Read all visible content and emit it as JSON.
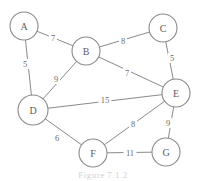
{
  "figure": {
    "caption": "Figure 7.1.2",
    "width": 206,
    "height": 181,
    "line_color": "#8a8a8a",
    "text_color": "#5c5c5c",
    "background": "#ffffff"
  },
  "chart_data": {
    "type": "diagram",
    "subtype": "weighted-undirected-graph",
    "title": "Figure 7.1.2",
    "nodes": [
      {
        "id": "A",
        "label": "A",
        "x": 24,
        "y": 26,
        "r": 14
      },
      {
        "id": "B",
        "label": "B",
        "x": 86,
        "y": 51,
        "r": 14
      },
      {
        "id": "C",
        "label": "C",
        "x": 163,
        "y": 28,
        "r": 14
      },
      {
        "id": "D",
        "label": "D",
        "x": 33,
        "y": 110,
        "r": 15
      },
      {
        "id": "E",
        "label": "E",
        "x": 176,
        "y": 93,
        "r": 14
      },
      {
        "id": "F",
        "label": "F",
        "x": 93,
        "y": 153,
        "r": 14
      },
      {
        "id": "G",
        "label": "G",
        "x": 166,
        "y": 152,
        "r": 14
      }
    ],
    "edges": [
      {
        "source": "A",
        "target": "B",
        "weight": 7,
        "label": "7",
        "lx": 53,
        "ly": 38
      },
      {
        "source": "A",
        "target": "D",
        "weight": 5,
        "label": "5",
        "lx": 25,
        "ly": 64
      },
      {
        "source": "B",
        "target": "C",
        "weight": 8,
        "label": "8",
        "lx": 123,
        "ly": 41
      },
      {
        "source": "B",
        "target": "D",
        "weight": 9,
        "label": "9",
        "lx": 56,
        "ly": 79
      },
      {
        "source": "B",
        "target": "E",
        "weight": 7,
        "label": "7",
        "lx": 127,
        "ly": 73
      },
      {
        "source": "C",
        "target": "E",
        "weight": 5,
        "label": "5",
        "lx": 172,
        "ly": 58
      },
      {
        "source": "D",
        "target": "E",
        "weight": 15,
        "label": "15",
        "lx": 105,
        "ly": 100
      },
      {
        "source": "D",
        "target": "F",
        "weight": 6,
        "label": "6",
        "lx": 57,
        "ly": 138
      },
      {
        "source": "E",
        "target": "F",
        "weight": 8,
        "label": "8",
        "lx": 133,
        "ly": 124
      },
      {
        "source": "E",
        "target": "G",
        "weight": 9,
        "label": "9",
        "lx": 168,
        "ly": 123
      },
      {
        "source": "F",
        "target": "G",
        "weight": 11,
        "label": "11",
        "lx": 130,
        "ly": 153
      }
    ],
    "xlabel": "",
    "ylabel": "",
    "grid": false,
    "legend": false
  }
}
